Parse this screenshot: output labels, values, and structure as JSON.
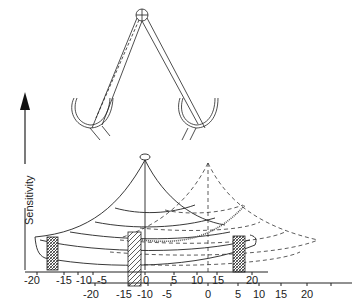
{
  "figure": {
    "y_axis_label": "Sensitivity",
    "upper_axis_ticks": [
      "-20",
      "-15",
      "-10",
      "-5",
      "0",
      "5",
      "10",
      "15",
      "20"
    ],
    "lower_axis_ticks": [
      "-20",
      "-15",
      "-10",
      "-5",
      "0",
      "5",
      "10",
      "15",
      "20"
    ],
    "colors": {
      "line": "#222222",
      "background": "#ffffff"
    }
  }
}
